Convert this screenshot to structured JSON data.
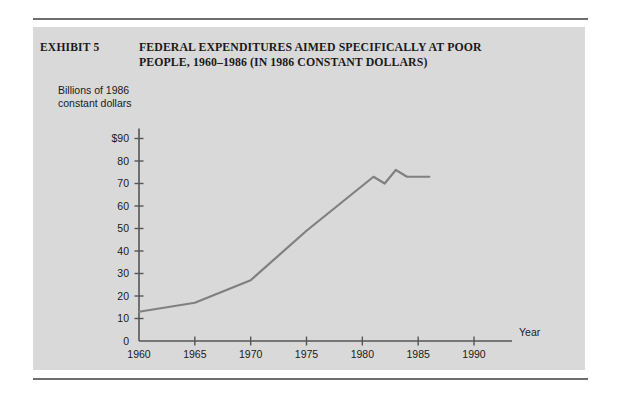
{
  "exhibit": {
    "label": "EXHIBIT 5",
    "title_line1": "FEDERAL EXPENDITURES AIMED SPECIFICALLY AT POOR",
    "title_line2": "PEOPLE, 1960–1986 (IN 1986 CONSTANT DOLLARS)"
  },
  "axis_caption": {
    "line1": "Billions of 1986",
    "line2": "constant dollars"
  },
  "colors": {
    "panel_background": "#d9d9d9",
    "page_background": "#ffffff",
    "rule": "#6e6e6e",
    "axis": "#555555",
    "series_line": "#808080",
    "text": "#1a1a1a"
  },
  "chart_data": {
    "type": "line",
    "title": "FEDERAL EXPENDITURES AIMED SPECIFICALLY AT POOR PEOPLE, 1960–1986 (IN 1986 CONSTANT DOLLARS)",
    "subtitle": "EXHIBIT 5",
    "xlabel": "Year",
    "ylabel": "Billions of 1986 constant dollars",
    "xlim": [
      1960,
      1992
    ],
    "ylim": [
      0,
      90
    ],
    "grid": false,
    "legend": null,
    "x_ticks": [
      1960,
      1965,
      1970,
      1975,
      1980,
      1985,
      1990
    ],
    "x_tick_labels": [
      "1960",
      "1965",
      "1970",
      "1975",
      "1980",
      "1985",
      "1990"
    ],
    "y_ticks": [
      0,
      10,
      20,
      30,
      40,
      50,
      60,
      70,
      80,
      90
    ],
    "y_tick_labels": [
      "0",
      "10",
      "20",
      "30",
      "40",
      "50",
      "60",
      "70",
      "80",
      "$90"
    ],
    "series": [
      {
        "name": "Federal expenditures aimed specifically at poor people",
        "x": [
          1960,
          1965,
          1970,
          1975,
          1981,
          1982,
          1983,
          1984,
          1986
        ],
        "values": [
          13,
          17,
          27,
          49,
          73,
          70,
          76,
          73,
          73
        ]
      }
    ]
  }
}
